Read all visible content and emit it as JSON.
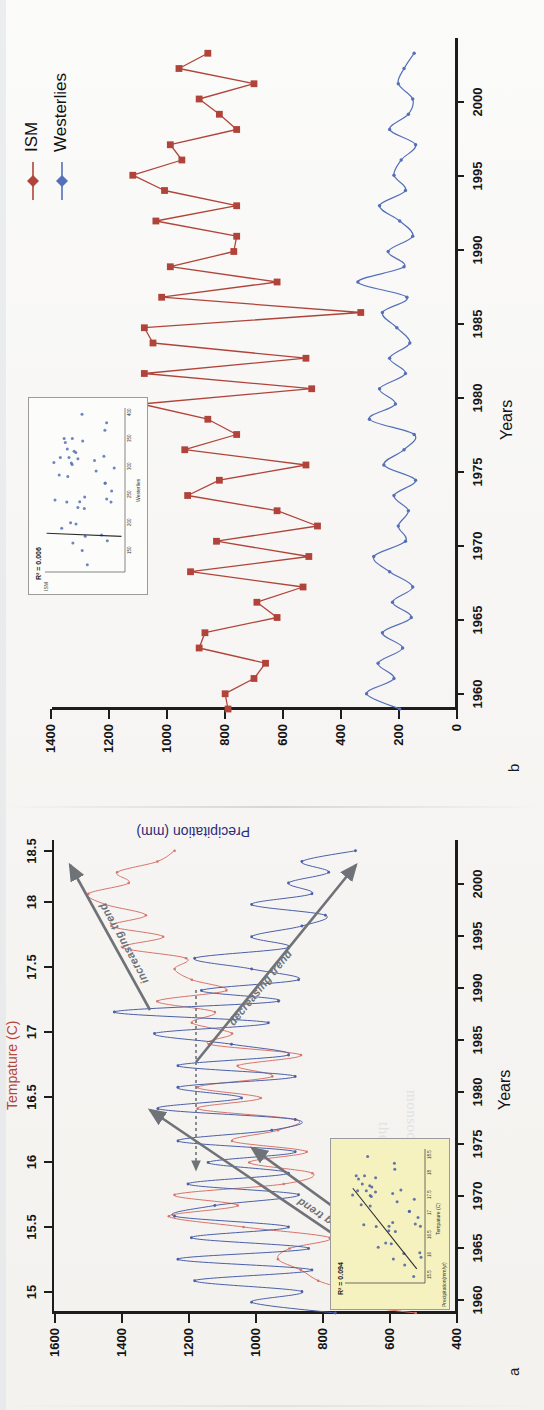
{
  "figure": {
    "orientation": "rotated-90-ccw",
    "panels": [
      {
        "letter": "a",
        "x_axis_label": "Years",
        "y_left_label": "Precipitation (mm)",
        "y_right_label": "Tempature (C)",
        "annotations": [
          "decreasing trend",
          "increasing trend",
          "decreasing trend",
          "increasing trend"
        ]
      },
      {
        "letter": "b",
        "x_axis_label": "Years",
        "y_left_label": "Precipitation (mm)",
        "legend": [
          "ISM",
          "Westerlies"
        ]
      }
    ]
  },
  "colors": {
    "ism_red": "#b0443a",
    "westerlies_blue": "#5470b8",
    "temp_red": "#d9736a",
    "precip_blue": "#4a5fa8",
    "axis_black": "#1d1d1d",
    "arrow_gray": "#6f7277",
    "inset_a_bg": "#f6f2bf",
    "inset_b_bg": "#fcfcfa",
    "paper": "#f5f4f1"
  },
  "panel_b": {
    "letter": "b",
    "x_label": "Years",
    "y_label": "Precipitation (mm)",
    "legend": [
      {
        "name": "ISM",
        "color": "#b0443a",
        "marker": "diamond"
      },
      {
        "name": "Westerlies",
        "color": "#5470b8",
        "marker": "diamond"
      }
    ],
    "inset": {
      "r2_label": "R² = 0.006",
      "x_title": "Westerlies",
      "y_title": "ISM",
      "x_ticks": [
        "150",
        "200",
        "250",
        "300",
        "350",
        "400"
      ],
      "y_ticks": [
        "600",
        "800",
        "1000",
        "1200",
        "1400"
      ]
    }
  },
  "panel_a": {
    "letter": "a",
    "x_label": "Years",
    "y_label_left": "Precipitation (mm)",
    "y_label_right": "Tempature (C)",
    "trend_labels": [
      "decreasing trend",
      "increasing trend",
      "decreasing trend",
      "increasing trend"
    ],
    "inset": {
      "r2_label": "R² = 0.094",
      "x_title": "Tempature (C)",
      "y_title": "Precipitation(mm/yr)",
      "x_ticks": [
        "15.5",
        "16",
        "16.5",
        "17",
        "17.5",
        "18",
        "18.5"
      ],
      "y_ticks": [
        "140",
        "120",
        "100",
        "80",
        "60",
        "40",
        "20"
      ]
    }
  },
  "chart_data": [
    {
      "type": "line",
      "title": "b",
      "xlabel": "Years",
      "ylabel": "Precipitation (mm)",
      "xlim": [
        1959,
        2003
      ],
      "ylim": [
        0,
        1400
      ],
      "xticks": [
        1960,
        1965,
        1970,
        1975,
        1980,
        1985,
        1990,
        1995,
        2000
      ],
      "yticks": [
        0,
        200,
        400,
        600,
        800,
        1000,
        1200,
        1400
      ],
      "grid": false,
      "legend_position": "top-right",
      "x": [
        1959,
        1960,
        1961,
        1962,
        1963,
        1964,
        1965,
        1966,
        1967,
        1968,
        1969,
        1970,
        1971,
        1972,
        1973,
        1974,
        1975,
        1976,
        1977,
        1978,
        1979,
        1980,
        1981,
        1982,
        1983,
        1984,
        1985,
        1986,
        1987,
        1988,
        1989,
        1990,
        1991,
        1992,
        1993,
        1994,
        1995,
        1996,
        1997,
        1998,
        1999,
        2000,
        2001,
        2002
      ],
      "series": [
        {
          "name": "ISM",
          "color": "#b0443a",
          "marker": "square",
          "values": [
            790,
            800,
            700,
            660,
            890,
            870,
            620,
            690,
            530,
            920,
            510,
            830,
            480,
            620,
            930,
            820,
            520,
            940,
            760,
            860,
            1090,
            500,
            1080,
            520,
            1050,
            1080,
            330,
            1020,
            620,
            990,
            770,
            760,
            1040,
            760,
            1010,
            1120,
            950,
            990,
            760,
            820,
            890,
            700,
            960,
            860
          ]
        },
        {
          "name": "Westerlies",
          "color": "#5470b8",
          "marker": "circle",
          "values": [
            195,
            310,
            215,
            270,
            185,
            255,
            155,
            220,
            150,
            230,
            285,
            175,
            200,
            165,
            215,
            140,
            250,
            180,
            145,
            300,
            210,
            265,
            175,
            230,
            160,
            205,
            255,
            170,
            340,
            180,
            235,
            150,
            195,
            265,
            175,
            215,
            190,
            140,
            230,
            165,
            150,
            200,
            180,
            145
          ]
        }
      ]
    },
    {
      "type": "line",
      "title": "a",
      "xlabel": "Years",
      "ylabel_left": "Precipitation (mm)",
      "ylabel_right": "Tempature (C)",
      "xlim": [
        1959,
        2003
      ],
      "ylim_left": [
        400,
        1600
      ],
      "ylim_right": [
        15,
        18.5
      ],
      "xticks": [
        1960,
        1965,
        1970,
        1975,
        1980,
        1985,
        1990,
        1995,
        2000
      ],
      "yticks_left": [
        400,
        600,
        800,
        1000,
        1200,
        1400,
        1600
      ],
      "yticks_right": [
        15,
        15.5,
        16,
        16.5,
        17,
        17.5,
        18,
        18.5
      ],
      "grid": false,
      "x": [
        1959,
        1960,
        1961,
        1962,
        1963,
        1964,
        1965,
        1966,
        1967,
        1968,
        1969,
        1970,
        1971,
        1972,
        1973,
        1974,
        1975,
        1976,
        1977,
        1978,
        1979,
        1980,
        1981,
        1982,
        1983,
        1984,
        1985,
        1986,
        1987,
        1988,
        1989,
        1990,
        1991,
        1992,
        1993,
        1994,
        1995,
        1996,
        1997,
        1998,
        1999,
        2000,
        2001,
        2002
      ],
      "series": [
        {
          "name": "Precipitation",
          "color": "#4a5fa8",
          "marker": "dot",
          "values": [
            760,
            1010,
            860,
            1180,
            830,
            1230,
            840,
            1190,
            900,
            1240,
            1120,
            870,
            1200,
            900,
            1140,
            880,
            1230,
            950,
            880,
            1290,
            1040,
            1230,
            880,
            1230,
            900,
            1070,
            1300,
            960,
            1420,
            930,
            1160,
            870,
            1010,
            1180,
            900,
            1010,
            860,
            790,
            1010,
            830,
            900,
            780,
            860,
            700
          ]
        },
        {
          "name": "Tempature",
          "color": "#d9736a",
          "marker": "dot",
          "values": [
            15.35,
            16.05,
            15.95,
            16.2,
            16.35,
            16.55,
            16.45,
            16.1,
            16.85,
            17.5,
            16.9,
            17.45,
            16.5,
            16.25,
            16.8,
            16.3,
            16.95,
            16.55,
            16.4,
            17.25,
            16.7,
            17.25,
            16.6,
            16.9,
            16.35,
            17.15,
            16.95,
            17.3,
            17.1,
            17.6,
            17.0,
            17.3,
            17.45,
            17.35,
            17.9,
            17.55,
            18.0,
            17.7,
            18.05,
            18.2,
            17.85,
            17.95,
            17.6,
            17.45
          ]
        }
      ]
    },
    {
      "type": "scatter",
      "title": "R² = 0.006",
      "xlabel": "Westerlies",
      "ylabel": "ISM",
      "xlim": [
        100,
        420
      ],
      "ylim": [
        500,
        1450
      ],
      "trend": "near-vertical fit line",
      "n_points": 42
    },
    {
      "type": "scatter",
      "title": "R² = 0.094",
      "xlabel": "Tempature (C)",
      "ylabel": "Precipitation(mm/yr)",
      "xlim": [
        15,
        18.6
      ],
      "ylim": [
        20,
        145
      ],
      "trend": "positive slope fit line",
      "n_points": 42
    }
  ]
}
